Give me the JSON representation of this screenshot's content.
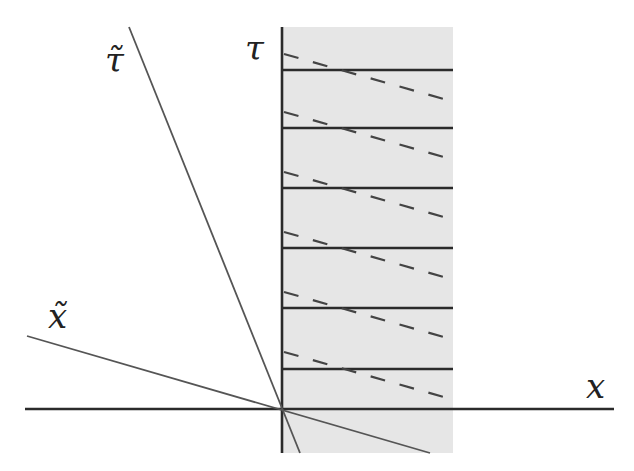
{
  "diagram": {
    "labels": {
      "tau_tilde": "τ̃",
      "tau": "τ",
      "x_tilde": "x̃",
      "x": "x"
    },
    "colors": {
      "strip_fill": "#e6e6e6",
      "axis_stroke": "#2b2b2b",
      "skew_axis_stroke": "#555555",
      "dash_stroke": "#444444",
      "background": "#ffffff"
    },
    "strip": {
      "x0": 282,
      "x1": 453,
      "y0": 27,
      "y1": 453
    },
    "origin": {
      "x": 282,
      "y": 409
    },
    "horizontal_lines_y": [
      70,
      128,
      188,
      248,
      308,
      369
    ],
    "dashed_line_offset_above": 16,
    "dashed_slope": 0.278
  }
}
